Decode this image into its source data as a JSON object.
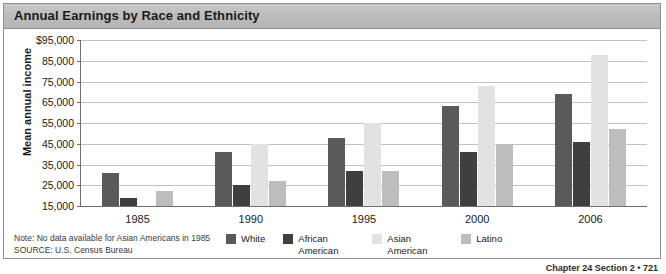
{
  "figure": {
    "title": "Annual Earnings by Race and Ethnicity",
    "note": "Note: No data available for Asian Americans in 1985",
    "source_keyword": "SOURCE:",
    "source_text": " U.S. Census Bureau",
    "page_footer": "Chapter 24 Section 2   •   721"
  },
  "colors": {
    "white": "#5a5a5a",
    "african_american": "#3f3f3f",
    "asian_american": "#e2e2e2",
    "latino": "#bdbdbd",
    "grid": "#c2c2c2",
    "axis": "#6f6f6f",
    "title_band": "#bdbdbd"
  },
  "chart_data": {
    "type": "bar",
    "title": "Annual Earnings by Race and Ethnicity",
    "xlabel": "",
    "ylabel": "Mean annual income",
    "ylim": [
      15000,
      95000
    ],
    "ytick_labels": [
      "$95,000",
      "85,000",
      "75,000",
      "65,000",
      "55,000",
      "45,000",
      "35,000",
      "25,000",
      "15,000"
    ],
    "ytick_values": [
      95000,
      85000,
      75000,
      65000,
      55000,
      45000,
      35000,
      25000,
      15000
    ],
    "grid": true,
    "legend_position": "bottom",
    "categories": [
      "1985",
      "1990",
      "1995",
      "2000",
      "2006"
    ],
    "series": [
      {
        "name": "White",
        "key": "white",
        "values": [
          31000,
          41000,
          48000,
          63000,
          69000
        ]
      },
      {
        "name": "African American",
        "key": "african_american",
        "values": [
          19000,
          25000,
          32000,
          41000,
          46000
        ]
      },
      {
        "name": "Asian American",
        "key": "asian_american",
        "values": [
          null,
          45000,
          55000,
          73000,
          88000
        ]
      },
      {
        "name": "Latino",
        "key": "latino",
        "values": [
          22000,
          27000,
          32000,
          45000,
          52000
        ]
      }
    ]
  }
}
